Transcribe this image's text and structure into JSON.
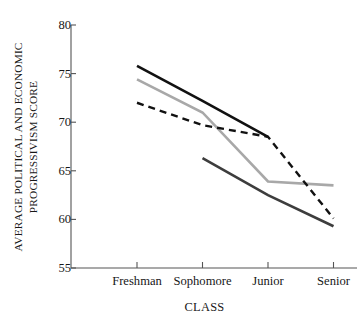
{
  "figure": {
    "title_remnant": "",
    "background_color": "#ffffff"
  },
  "chart_data": {
    "type": "line",
    "title": "",
    "xlabel": "CLASS",
    "ylabel": "AVERAGE POLITICAL AND ECONOMIC PROGRESSIVISM SCORE",
    "ylabel_line1": "AVERAGE POLITICAL AND ECONOMIC",
    "ylabel_line2": "PROGRESSIVISM SCORE",
    "categories": [
      "Freshman",
      "Sophomore",
      "Junior",
      "Senior"
    ],
    "ylim": [
      55,
      80
    ],
    "yticks": [
      55,
      60,
      65,
      70,
      75,
      80
    ],
    "ytick_labels": [
      "55",
      "60",
      "65",
      "70",
      "75",
      "80"
    ],
    "grid": false,
    "legend": "none",
    "series": [
      {
        "name": "series-black-solid",
        "style": "solid",
        "color": "#111111",
        "width": 2.6,
        "x": [
          "Freshman",
          "Sophomore",
          "Junior"
        ],
        "values": [
          75.8,
          72.2,
          68.5
        ]
      },
      {
        "name": "series-light-gray-solid",
        "style": "solid",
        "color": "#a8a8a8",
        "width": 2.6,
        "x": [
          "Freshman",
          "Sophomore",
          "Junior",
          "Senior"
        ],
        "values": [
          74.4,
          71.0,
          63.9,
          63.5
        ]
      },
      {
        "name": "series-black-dashed",
        "style": "dashed",
        "color": "#111111",
        "width": 2.4,
        "x": [
          "Freshman",
          "Sophomore",
          "Junior",
          "Senior"
        ],
        "values": [
          72.0,
          69.7,
          68.5,
          60.1
        ]
      },
      {
        "name": "series-dark-gray-solid",
        "style": "solid",
        "color": "#3d3d3d",
        "width": 2.6,
        "x": [
          "Sophomore",
          "Junior",
          "Senior"
        ],
        "values": [
          66.3,
          62.5,
          59.3
        ]
      }
    ]
  }
}
